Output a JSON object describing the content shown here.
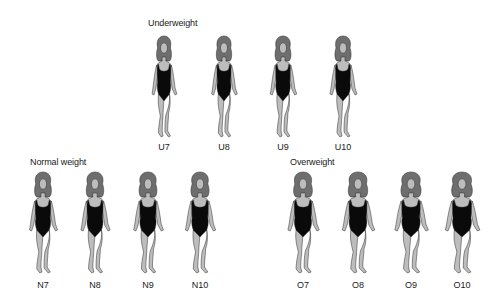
{
  "groups": [
    {
      "title": "Underweight",
      "title_pos": [
        148,
        18
      ],
      "figures": [
        {
          "label": "U7",
          "x": 164,
          "top": 36,
          "bottom": 140,
          "scale": 0.92
        },
        {
          "label": "U8",
          "x": 224,
          "top": 36,
          "bottom": 140,
          "scale": 0.95
        },
        {
          "label": "U9",
          "x": 283,
          "top": 36,
          "bottom": 140,
          "scale": 0.98
        },
        {
          "label": "U10",
          "x": 343,
          "top": 36,
          "bottom": 140,
          "scale": 1.0
        }
      ]
    },
    {
      "title": "Normal weight",
      "title_pos": [
        30,
        157
      ],
      "figures": [
        {
          "label": "N7",
          "x": 43,
          "top": 172,
          "bottom": 278,
          "scale": 1.04
        },
        {
          "label": "N8",
          "x": 95,
          "top": 172,
          "bottom": 278,
          "scale": 1.08
        },
        {
          "label": "N9",
          "x": 148,
          "top": 172,
          "bottom": 278,
          "scale": 1.1
        },
        {
          "label": "N10",
          "x": 200,
          "top": 172,
          "bottom": 278,
          "scale": 1.12
        }
      ]
    },
    {
      "title": "Overweight",
      "title_pos": [
        290,
        157
      ],
      "figures": [
        {
          "label": "O7",
          "x": 303,
          "top": 172,
          "bottom": 278,
          "scale": 1.16
        },
        {
          "label": "O8",
          "x": 358,
          "top": 172,
          "bottom": 278,
          "scale": 1.2
        },
        {
          "label": "O9",
          "x": 411,
          "top": 172,
          "bottom": 278,
          "scale": 1.24
        },
        {
          "label": "O10",
          "x": 462,
          "top": 172,
          "bottom": 278,
          "scale": 1.28
        }
      ]
    }
  ],
  "colors": {
    "skin": "#bdbdbd",
    "outline": "#2a2a2a",
    "hair": "#6e6e6e",
    "swimsuit": "#0a0a0a",
    "text": "#1a1a1a"
  }
}
